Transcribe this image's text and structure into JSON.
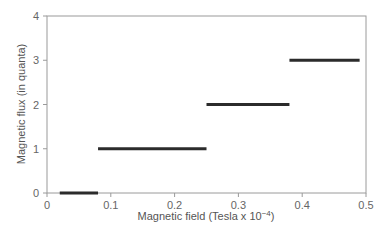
{
  "chart_data": {
    "type": "line",
    "title": "",
    "xlabel": "Magnetic field (Tesla x 10⁻⁴)",
    "ylabel": "Magnetic flux (in quanta)",
    "xlim": [
      0,
      0.5
    ],
    "ylim": [
      0,
      4
    ],
    "x_ticks": [
      "0",
      "0.1",
      "0.2",
      "0.3",
      "0.4",
      "0.5"
    ],
    "y_ticks": [
      "0",
      "1",
      "2",
      "3",
      "4"
    ],
    "grid": false,
    "legend": null,
    "series": [
      {
        "name": "flux steps",
        "style": "horizontal-segments",
        "color": "#2b2b2b",
        "segments": [
          {
            "x_start": 0.02,
            "x_end": 0.08,
            "y": 0
          },
          {
            "x_start": 0.08,
            "x_end": 0.25,
            "y": 1
          },
          {
            "x_start": 0.25,
            "x_end": 0.38,
            "y": 2
          },
          {
            "x_start": 0.38,
            "x_end": 0.49,
            "y": 3
          }
        ]
      }
    ]
  },
  "labels": {
    "xlabel_main": "Magnetic field (Tesla x 10",
    "xlabel_sup": "−4",
    "xlabel_end": ")",
    "ylabel": "Magnetic flux (in quanta)"
  },
  "colors": {
    "frame": "#9a9a9a",
    "segment": "#2b2b2b"
  }
}
